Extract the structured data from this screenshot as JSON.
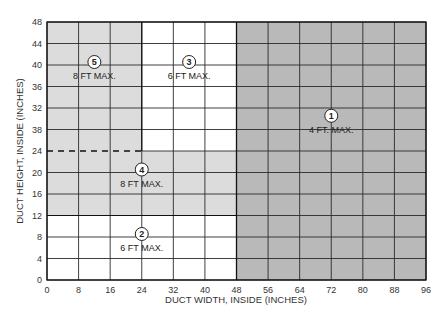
{
  "chart_data": {
    "type": "heatmap",
    "title": "",
    "xlabel": "DUCT WIDTH, INSIDE (INCHES)",
    "ylabel": "DUCT HEIGHT, INSIDE (INCHES)",
    "xlim": [
      0,
      96
    ],
    "ylim": [
      0,
      48
    ],
    "grid": true,
    "x_ticks": [
      0,
      8,
      16,
      24,
      32,
      40,
      48,
      56,
      64,
      72,
      80,
      88,
      96
    ],
    "x_tick_labels": [
      "0",
      "8",
      "16",
      "24",
      "32",
      "40",
      "48",
      "56",
      "64",
      "72",
      "80",
      "88",
      "96"
    ],
    "y_ticks": [
      0,
      4,
      8,
      12,
      16,
      20,
      24,
      28,
      32,
      36,
      40,
      44,
      48
    ],
    "y_tick_labels": [
      "0",
      "4",
      "8",
      "12",
      "16",
      "20",
      "24",
      "38",
      "32",
      "36",
      "40",
      "44",
      "48"
    ],
    "regions": [
      {
        "id": "1",
        "label": "4 FT. MAX.",
        "x_range": [
          48,
          96
        ],
        "y_range": [
          0,
          48
        ],
        "fill": "#b9b9b9",
        "label_pos": [
          72,
          30
        ]
      },
      {
        "id": "2",
        "label": "6 FT MAX.",
        "x_range": [
          0,
          48
        ],
        "y_range": [
          0,
          12
        ],
        "fill": "#ffffff",
        "label_pos": [
          24,
          8
        ]
      },
      {
        "id": "3",
        "label": "6 FT MAX.",
        "x_range": [
          24,
          48
        ],
        "y_range": [
          24,
          48
        ],
        "fill": "#ffffff",
        "label_pos": [
          36,
          40
        ]
      },
      {
        "id": "4",
        "label": "8 FT MAX.",
        "x_range": [
          0,
          48
        ],
        "y_range": [
          12,
          24
        ],
        "fill": "#dcdcdc",
        "label_pos": [
          24,
          20
        ]
      },
      {
        "id": "5",
        "label": "8 FT MAX.",
        "x_range": [
          0,
          24
        ],
        "y_range": [
          24,
          48
        ],
        "fill": "#dcdcdc",
        "label_pos": [
          12,
          40
        ]
      }
    ],
    "annotations": [
      {
        "type": "dashed-line",
        "from": [
          0,
          24
        ],
        "to": [
          24,
          24
        ]
      }
    ]
  }
}
